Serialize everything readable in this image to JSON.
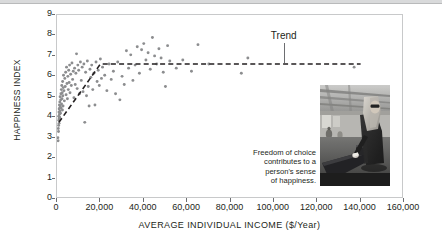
{
  "chart_data": {
    "type": "scatter",
    "title": "",
    "xlabel": "AVERAGE INDIVIDUAL INCOME ($/Year)",
    "ylabel": "HAPPINESS INDEX",
    "xlim": [
      0,
      160000
    ],
    "ylim": [
      0,
      9
    ],
    "xticks": [
      0,
      20000,
      40000,
      60000,
      80000,
      100000,
      120000,
      140000,
      160000
    ],
    "xtick_labels": [
      "0",
      "20,000",
      "40,000",
      "60,000",
      "80,000",
      "100,000",
      "120,000",
      "140,000",
      "160,000"
    ],
    "yticks": [
      0,
      1,
      2,
      3,
      4,
      5,
      6,
      7,
      8,
      9
    ],
    "ytick_labels": [
      "0",
      "1",
      "2",
      "3",
      "4",
      "5",
      "6",
      "7",
      "8",
      "9"
    ],
    "grid": false,
    "legend": false,
    "point_color": "#8c8d8f",
    "trend_color": "#231f20",
    "axis_color": "#6d6e71",
    "frame_color": "#c8c9ca",
    "series": [
      {
        "name": "Countries",
        "marker": "circle",
        "points": [
          [
            400,
            3.0
          ],
          [
            500,
            2.85
          ],
          [
            600,
            3.45
          ],
          [
            700,
            3.3
          ],
          [
            750,
            3.6
          ],
          [
            800,
            4.05
          ],
          [
            850,
            3.85
          ],
          [
            900,
            4.25
          ],
          [
            950,
            3.7
          ],
          [
            1000,
            4.4
          ],
          [
            1050,
            3.95
          ],
          [
            1100,
            4.6
          ],
          [
            1150,
            4.15
          ],
          [
            1200,
            4.0
          ],
          [
            1250,
            4.45
          ],
          [
            1300,
            4.75
          ],
          [
            1400,
            4.3
          ],
          [
            1450,
            5.0
          ],
          [
            1500,
            4.55
          ],
          [
            1600,
            4.2
          ],
          [
            1700,
            4.85
          ],
          [
            1800,
            5.15
          ],
          [
            1900,
            4.45
          ],
          [
            2000,
            5.35
          ],
          [
            2100,
            4.65
          ],
          [
            2200,
            5.55
          ],
          [
            2300,
            4.9
          ],
          [
            2400,
            5.2
          ],
          [
            2500,
            4.35
          ],
          [
            2600,
            5.75
          ],
          [
            2700,
            5.05
          ],
          [
            2800,
            4.55
          ],
          [
            2900,
            5.45
          ],
          [
            3000,
            6.05
          ],
          [
            3200,
            5.3
          ],
          [
            3400,
            4.8
          ],
          [
            3600,
            5.9
          ],
          [
            3800,
            5.5
          ],
          [
            4000,
            6.2
          ],
          [
            4200,
            5.1
          ],
          [
            4400,
            6.45
          ],
          [
            4600,
            5.65
          ],
          [
            4800,
            4.9
          ],
          [
            5000,
            6.0
          ],
          [
            5200,
            5.35
          ],
          [
            5400,
            6.3
          ],
          [
            5600,
            5.7
          ],
          [
            5800,
            6.55
          ],
          [
            6000,
            5.2
          ],
          [
            6300,
            6.1
          ],
          [
            6600,
            5.55
          ],
          [
            6900,
            6.65
          ],
          [
            7200,
            5.85
          ],
          [
            7500,
            6.25
          ],
          [
            7800,
            4.95
          ],
          [
            8100,
            6.4
          ],
          [
            8400,
            5.6
          ],
          [
            8700,
            6.15
          ],
          [
            9000,
            7.1
          ],
          [
            9300,
            5.4
          ],
          [
            9600,
            6.55
          ],
          [
            10000,
            6.3
          ],
          [
            10400,
            5.15
          ],
          [
            10800,
            6.7
          ],
          [
            11200,
            5.8
          ],
          [
            11600,
            6.45
          ],
          [
            12000,
            5.25
          ],
          [
            12400,
            6.6
          ],
          [
            12800,
            3.75
          ],
          [
            13200,
            6.2
          ],
          [
            13600,
            5.05
          ],
          [
            14000,
            6.75
          ],
          [
            14400,
            5.5
          ],
          [
            14800,
            4.55
          ],
          [
            15200,
            6.35
          ],
          [
            15600,
            5.95
          ],
          [
            16000,
            6.55
          ],
          [
            16500,
            5.35
          ],
          [
            17000,
            6.15
          ],
          [
            17500,
            4.6
          ],
          [
            18000,
            6.7
          ],
          [
            18500,
            5.75
          ],
          [
            19000,
            6.3
          ],
          [
            19500,
            5.55
          ],
          [
            20000,
            6.85
          ],
          [
            20500,
            5.9
          ],
          [
            21000,
            6.45
          ],
          [
            22000,
            6.05
          ],
          [
            23000,
            5.3
          ],
          [
            24000,
            6.6
          ],
          [
            25000,
            5.85
          ],
          [
            26000,
            6.25
          ],
          [
            27000,
            5.15
          ],
          [
            28000,
            6.7
          ],
          [
            29000,
            4.85
          ],
          [
            30000,
            6.0
          ],
          [
            31000,
            5.6
          ],
          [
            32000,
            7.25
          ],
          [
            33000,
            6.4
          ],
          [
            34000,
            7.05
          ],
          [
            35000,
            5.8
          ],
          [
            36000,
            6.55
          ],
          [
            37000,
            7.45
          ],
          [
            38000,
            6.15
          ],
          [
            39000,
            7.3
          ],
          [
            40000,
            7.6
          ],
          [
            41000,
            6.8
          ],
          [
            42000,
            7.15
          ],
          [
            43000,
            6.35
          ],
          [
            44000,
            7.9
          ],
          [
            45000,
            7.0
          ],
          [
            46000,
            6.6
          ],
          [
            47000,
            7.35
          ],
          [
            48000,
            6.9
          ],
          [
            49000,
            6.2
          ],
          [
            50000,
            5.5
          ],
          [
            51000,
            7.5
          ],
          [
            52000,
            6.75
          ],
          [
            55000,
            6.4
          ],
          [
            58000,
            6.8
          ],
          [
            62000,
            6.25
          ],
          [
            65000,
            7.55
          ],
          [
            70000,
            6.6
          ],
          [
            85000,
            6.15
          ],
          [
            88000,
            6.9
          ],
          [
            137000,
            6.45
          ]
        ]
      }
    ],
    "trend_line": {
      "name": "Trend",
      "style": "dashed",
      "label": "Trend",
      "label_x": 105000,
      "points": [
        [
          900,
          3.75
        ],
        [
          20000,
          6.6
        ],
        [
          140000,
          6.6
        ]
      ]
    },
    "annotations": [
      {
        "name": "trend-callout",
        "text": "Trend",
        "x": 105000,
        "y": 7.9
      }
    ]
  },
  "caption": {
    "lines": [
      "Freedom of choice",
      "contributes to a",
      "person's sense",
      "of happiness."
    ]
  },
  "photo": {
    "alt": "Woman in headscarf casting a ballot into a ballot box"
  }
}
